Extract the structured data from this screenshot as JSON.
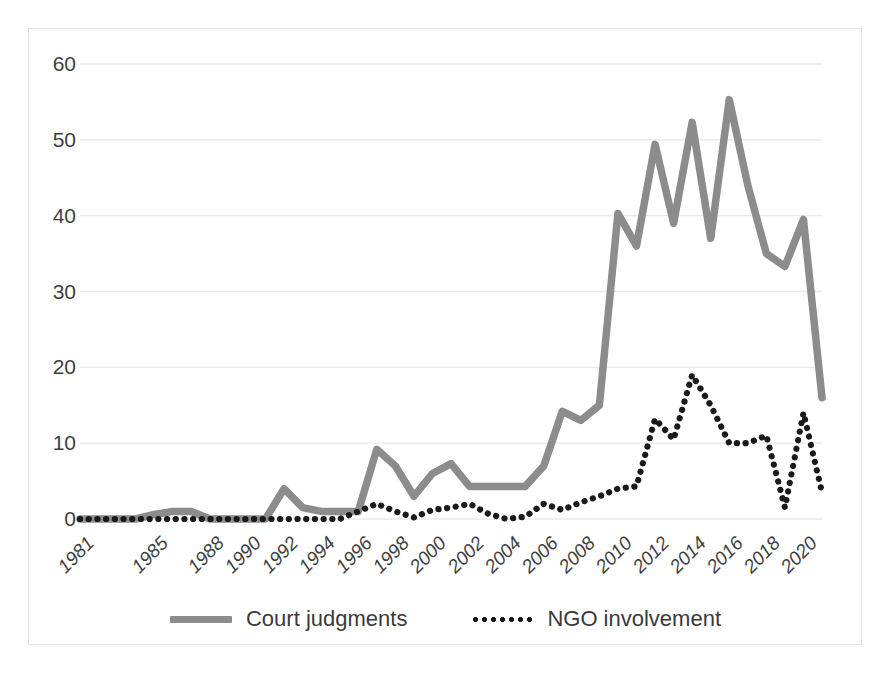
{
  "chart_data": {
    "type": "line",
    "title": "",
    "subtitle": "",
    "xlabel": "",
    "ylabel": "",
    "xlim": [
      1981,
      2021
    ],
    "ylim": [
      0,
      60
    ],
    "y_ticks": [
      0,
      10,
      20,
      30,
      40,
      50,
      60
    ],
    "y_tick_labels": [
      "0",
      "10",
      "20",
      "30",
      "40",
      "50",
      "60"
    ],
    "grid": "horizontal",
    "legend_position": "bottom-center",
    "x": [
      1981,
      1982,
      1983,
      1984,
      1985,
      1986,
      1987,
      1988,
      1989,
      1990,
      1991,
      1992,
      1993,
      1994,
      1995,
      1996,
      1997,
      1998,
      1999,
      2000,
      2001,
      2002,
      2003,
      2004,
      2005,
      2006,
      2007,
      2008,
      2009,
      2010,
      2011,
      2012,
      2013,
      2014,
      2015,
      2016,
      2017,
      2018,
      2019,
      2020,
      2021
    ],
    "x_tick_labels": [
      "1981",
      "1985",
      "1988",
      "1990",
      "1992",
      "1994",
      "1996",
      "1998",
      "2000",
      "2002",
      "2004",
      "2006",
      "2008",
      "2010",
      "2012",
      "2014",
      "2016",
      "2018",
      "2020"
    ],
    "x_tick_values": [
      1981,
      1985,
      1988,
      1990,
      1992,
      1994,
      1996,
      1998,
      2000,
      2002,
      2004,
      2006,
      2008,
      2010,
      2012,
      2014,
      2016,
      2018,
      2020
    ],
    "series": [
      {
        "name": "Court judgments",
        "style": "solid",
        "color": "#8c8c8c",
        "values": [
          0,
          0,
          0,
          0,
          0.6,
          1,
          1,
          0,
          0,
          0,
          0,
          4,
          1.5,
          1,
          1,
          1,
          9.2,
          7,
          3,
          6,
          7.3,
          4.3,
          4.3,
          4.3,
          4.3,
          7,
          14.2,
          13,
          15,
          40.3,
          36,
          49.4,
          39,
          52.3,
          37,
          55.3,
          44,
          35,
          33.3,
          39.5,
          16
        ]
      },
      {
        "name": "NGO involvement",
        "style": "dotted",
        "color": "#1a1a1a",
        "values": [
          0,
          0,
          0,
          0,
          0,
          0,
          0,
          0,
          0,
          0,
          0,
          0,
          0,
          0,
          0,
          1,
          2,
          1,
          0.2,
          1.2,
          1.5,
          2,
          0.7,
          0,
          0.3,
          2,
          1.2,
          2.2,
          3,
          4,
          4.3,
          4.6,
          13.2,
          10.5,
          19,
          15,
          10,
          10,
          9.5,
          8.2,
          11
        ]
      }
    ],
    "series_ngo_full": [
      0,
      0,
      0,
      0,
      0,
      0,
      0,
      0,
      0,
      0,
      0,
      0,
      0,
      0,
      0,
      1,
      2,
      1,
      0.2,
      1.2,
      1.5,
      2,
      0.7,
      0,
      0.3,
      2,
      1.2,
      2.2,
      3,
      4,
      4.3,
      13.2,
      10.5,
      19,
      15,
      10,
      10,
      11,
      1.5,
      14,
      3.5
    ]
  },
  "legend": {
    "entries": [
      {
        "label": "Court judgments",
        "marker": "solid-line-swatch"
      },
      {
        "label": "NGO involvement",
        "marker": "dotted-line-swatch"
      }
    ]
  },
  "colors": {
    "court_judgments": "#8c8c8c",
    "ngo_involvement": "#1a1a1a",
    "gridline": "#e8e8e8",
    "frame": "#e4e4e4",
    "text": "#3f3f3f",
    "background": "#ffffff"
  }
}
